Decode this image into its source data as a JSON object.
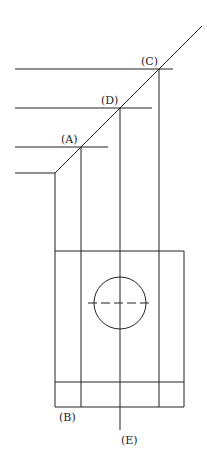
{
  "diagram": {
    "type": "orthographic-projection-construction",
    "labels": {
      "A": "(A)",
      "B": "(B)",
      "C": "(C)",
      "D": "(D)",
      "E": "(E)"
    },
    "colors": {
      "line": "#222222",
      "background": "#ffffff"
    }
  }
}
